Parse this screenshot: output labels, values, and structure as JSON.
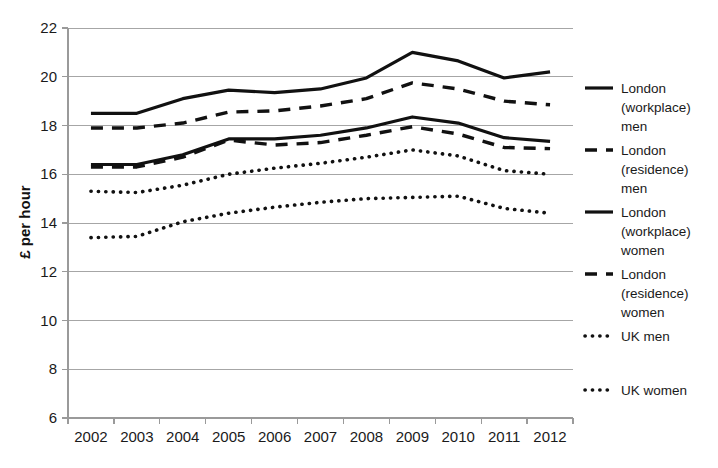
{
  "chart_data": {
    "type": "line",
    "title": "",
    "xlabel": "",
    "ylabel": "£ per hour",
    "x": [
      2002,
      2003,
      2004,
      2005,
      2006,
      2007,
      2008,
      2009,
      2010,
      2011,
      2012
    ],
    "categories": [
      "2002",
      "2003",
      "2004",
      "2005",
      "2006",
      "2007",
      "2008",
      "2009",
      "2010",
      "2011",
      "2012"
    ],
    "ylim": [
      6,
      22
    ],
    "yticks": [
      6,
      8,
      10,
      12,
      14,
      16,
      18,
      20,
      22
    ],
    "ytick_labels": [
      "6",
      "8",
      "10",
      "12",
      "14",
      "16",
      "18",
      "20",
      "22"
    ],
    "grid": true,
    "legend_position": "right",
    "series": [
      {
        "name": "London (workplace) men",
        "style": "solid",
        "values": [
          18.5,
          18.5,
          19.1,
          19.45,
          19.35,
          19.5,
          19.95,
          21.0,
          20.65,
          19.95,
          20.2
        ]
      },
      {
        "name": "London (residence) men",
        "style": "dashed",
        "values": [
          17.9,
          17.9,
          18.1,
          18.55,
          18.6,
          18.8,
          19.1,
          19.75,
          19.5,
          19.0,
          18.85
        ]
      },
      {
        "name": "London (workplace) women",
        "style": "solid",
        "values": [
          16.4,
          16.4,
          16.8,
          17.45,
          17.45,
          17.6,
          17.9,
          18.35,
          18.1,
          17.5,
          17.35
        ]
      },
      {
        "name": "London (residence) women",
        "style": "dashed",
        "values": [
          16.3,
          16.3,
          16.7,
          17.4,
          17.2,
          17.3,
          17.6,
          17.95,
          17.65,
          17.1,
          17.05
        ]
      },
      {
        "name": "UK men",
        "style": "dotted",
        "values": [
          15.3,
          15.25,
          15.55,
          16.0,
          16.25,
          16.45,
          16.7,
          17.0,
          16.75,
          16.15,
          16.0
        ]
      },
      {
        "name": "UK women",
        "style": "dotted",
        "values": [
          13.4,
          13.45,
          14.05,
          14.4,
          14.65,
          14.85,
          15.0,
          15.05,
          15.1,
          14.6,
          14.4
        ]
      }
    ]
  },
  "legend": {
    "entries": [
      {
        "label_lines": [
          "London",
          "(workplace)",
          "men"
        ],
        "style": "solid"
      },
      {
        "label_lines": [
          "London",
          "(residence)",
          "men"
        ],
        "style": "dashed"
      },
      {
        "label_lines": [
          "London",
          "(workplace)",
          "women"
        ],
        "style": "solid"
      },
      {
        "label_lines": [
          "London",
          "(residence)",
          "women"
        ],
        "style": "dashed"
      },
      {
        "label_lines": [
          "UK men"
        ],
        "style": "dotted"
      },
      {
        "label_lines": [
          "UK women"
        ],
        "style": "dotted"
      }
    ]
  },
  "colors": {
    "series": "#111111",
    "grid": "#a6a6a6",
    "axis": "#9a9a9a",
    "text": "#1a1a1a",
    "background": "#ffffff"
  }
}
